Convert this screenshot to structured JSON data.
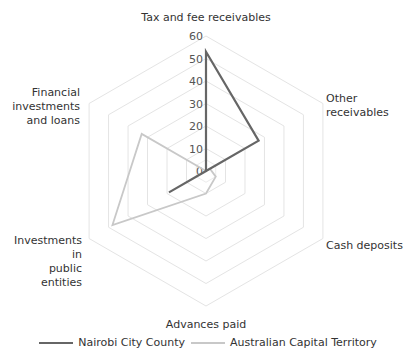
{
  "chart_data": {
    "type": "radar",
    "title": "",
    "categories": [
      "Tax and fee receivables",
      "Other receivables",
      "Cash deposits",
      "Advances paid",
      "Investments in public entities",
      "Financial investments and loans"
    ],
    "series": [
      {
        "name": "Nairobi City County",
        "color": "#666666",
        "values": [
          53,
          27,
          0,
          0,
          19,
          0
        ]
      },
      {
        "name": "Australian Capital Territory",
        "color": "#c8c8c8",
        "values": [
          0,
          2,
          5,
          10,
          48,
          33
        ]
      }
    ],
    "rlim": [
      0,
      60
    ],
    "ticks": [
      0,
      10,
      20,
      30,
      40,
      50,
      60
    ],
    "grid": true,
    "legend_position": "bottom"
  },
  "labels": {
    "tax": "Tax and fee receivables",
    "other": "Other receivables",
    "cash": "Cash deposits",
    "advances": "Advances paid",
    "public_1": "Investments in",
    "public_2": "public entities",
    "fin_1": "Financial",
    "fin_2": "investments",
    "fin_3": "and loans"
  },
  "legend": {
    "nairobi": "Nairobi City County",
    "act": "Australian Capital Territory"
  }
}
